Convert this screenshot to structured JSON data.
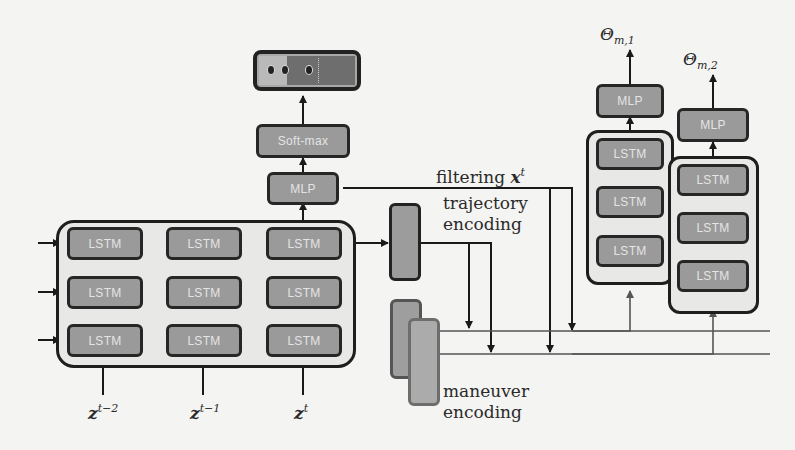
{
  "diagram": {
    "encoder": {
      "cell_label": "LSTM",
      "rows": 3,
      "cols": 3,
      "inputs": [
        {
          "label_base": "z",
          "label_sup": "t−2"
        },
        {
          "label_base": "z",
          "label_sup": "t−1"
        },
        {
          "label_base": "z",
          "label_sup": "t"
        }
      ]
    },
    "classifier": {
      "mlp_label": "MLP",
      "softmax_label": "Soft-max",
      "output_icon": "maneuver-probability-bar"
    },
    "annotations": {
      "filtering_prefix": "filtering ",
      "filtering_var": "x",
      "filtering_sup": "t",
      "trajectory_encoding": [
        "trajectory",
        "encoding"
      ],
      "maneuver_encoding": [
        "maneuver",
        "encoding"
      ]
    },
    "decoders": [
      {
        "cell_label": "LSTM",
        "mlp_label": "MLP",
        "output_base": "Θ",
        "output_sub": "m,1"
      },
      {
        "cell_label": "LSTM",
        "mlp_label": "MLP",
        "output_base": "Θ",
        "output_sub": "m,2"
      }
    ],
    "colors": {
      "box_fill": "#9a9a9a",
      "box_border": "#262626",
      "box_text": "#e4e4e4",
      "background": "#f4f4f2",
      "wire": "#222222"
    }
  }
}
